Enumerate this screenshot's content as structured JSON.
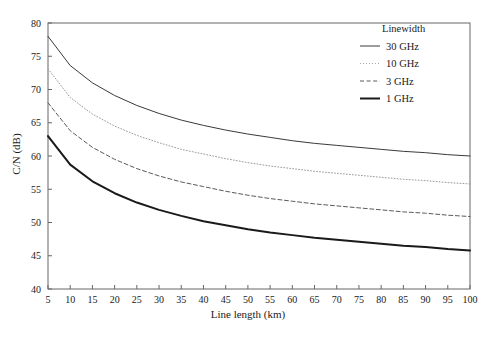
{
  "chart_data": {
    "type": "line",
    "title": "",
    "xlabel": "Line length (km)",
    "ylabel": "C/N (dB)",
    "xlim": [
      5,
      100
    ],
    "ylim": [
      40,
      80
    ],
    "xticks": [
      5,
      10,
      15,
      20,
      25,
      30,
      35,
      40,
      45,
      50,
      55,
      60,
      65,
      70,
      75,
      80,
      85,
      90,
      95,
      100
    ],
    "yticks": [
      40,
      45,
      50,
      55,
      60,
      65,
      70,
      75,
      80
    ],
    "grid": false,
    "legend": {
      "title": "Linewidth",
      "position": "top-right-inside",
      "entries": [
        {
          "label": "30 GHz",
          "style": "solid",
          "width": 1.0,
          "color": "#3a3a3a"
        },
        {
          "label": "10 GHz",
          "style": "dotted",
          "width": 1.0,
          "color": "#9a9a9a"
        },
        {
          "label": "3 GHz",
          "style": "dashed",
          "width": 1.0,
          "color": "#5a5a5a"
        },
        {
          "label": "1 GHz",
          "style": "solid",
          "width": 2.0,
          "color": "#1a1a1a"
        }
      ]
    },
    "x": [
      5,
      10,
      15,
      20,
      25,
      30,
      35,
      40,
      45,
      50,
      55,
      60,
      65,
      70,
      75,
      80,
      85,
      90,
      95,
      100
    ],
    "series": [
      {
        "name": "30 GHz",
        "values": [
          78.0,
          73.6,
          71.0,
          69.1,
          67.6,
          66.4,
          65.4,
          64.6,
          63.9,
          63.3,
          62.8,
          62.3,
          61.9,
          61.6,
          61.3,
          61.0,
          60.7,
          60.5,
          60.2,
          60.0
        ]
      },
      {
        "name": "10 GHz",
        "values": [
          73.1,
          68.8,
          66.3,
          64.5,
          63.1,
          62.0,
          61.0,
          60.3,
          59.6,
          59.0,
          58.5,
          58.1,
          57.7,
          57.4,
          57.1,
          56.8,
          56.5,
          56.3,
          56.0,
          55.8
        ]
      },
      {
        "name": "3 GHz",
        "values": [
          68.0,
          63.8,
          61.3,
          59.5,
          58.1,
          57.0,
          56.1,
          55.4,
          54.7,
          54.1,
          53.6,
          53.2,
          52.8,
          52.5,
          52.2,
          51.9,
          51.6,
          51.4,
          51.1,
          50.9
        ]
      },
      {
        "name": "1 GHz",
        "values": [
          63.0,
          58.7,
          56.2,
          54.4,
          53.0,
          51.9,
          51.0,
          50.2,
          49.6,
          49.0,
          48.5,
          48.1,
          47.7,
          47.4,
          47.1,
          46.8,
          46.5,
          46.3,
          46.0,
          45.8
        ]
      }
    ]
  }
}
